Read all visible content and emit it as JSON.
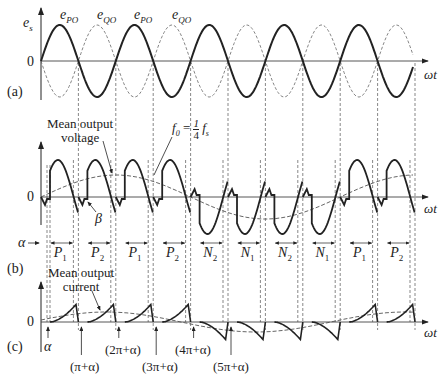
{
  "figure": {
    "panels": {
      "a": {
        "tag": "(a)",
        "y_axis_label": "e_s",
        "zero_label": "0",
        "x_axis_label": "ωt",
        "wave_labels": [
          "ePO",
          "eQO",
          "ePO",
          "eQO"
        ],
        "series": [
          {
            "name": "e_PO",
            "style": "solid-bold"
          },
          {
            "name": "e_QO",
            "style": "dashed"
          }
        ]
      },
      "b": {
        "tag": "(b)",
        "zero_label": "0",
        "x_axis_label": "ωt",
        "alpha_label": "α",
        "beta_label": "β",
        "annotation_mean_voltage": [
          "Mean output",
          "voltage"
        ],
        "frequency_annotation": "f0 = 1/4 fs",
        "intervals": [
          "P1",
          "P2",
          "P1",
          "P2",
          "N2",
          "N1",
          "N2",
          "N1",
          "P1",
          "P2"
        ]
      },
      "c": {
        "tag": "(c)",
        "zero_label": "0",
        "x_axis_label": "ωt",
        "annotation_mean_current": [
          "Mean output",
          "current"
        ],
        "angle_markers": [
          "α",
          "(π+α)",
          "(2π+α)",
          "(3π+α)",
          "(4π+α)",
          "(5π+α)"
        ]
      }
    },
    "colors": {
      "line": "#222222",
      "dashed": "#555555",
      "background": "#ffffff"
    }
  },
  "text": {
    "es": "e",
    "es_sub": "s",
    "e": "e",
    "po": "PO",
    "qo": "QO",
    "zero": "0",
    "wt": "ωt",
    "tag_a": "(a)",
    "tag_b": "(b)",
    "tag_c": "(c)",
    "mean_out": "Mean output",
    "voltage": "voltage",
    "current": "current",
    "f0": "f",
    "f0_sub": "0",
    "eq": " = ",
    "one": "1",
    "four": "4",
    "fs": "f",
    "fs_sub": "s",
    "alpha": "α",
    "beta": "β",
    "P": "P",
    "N": "N",
    "one_s": "1",
    "two_s": "2",
    "m1": "(π+α)",
    "m2": "(2π+α)",
    "m3": "(3π+α)",
    "m4": "(4π+α)",
    "m5": "(5π+α)"
  }
}
